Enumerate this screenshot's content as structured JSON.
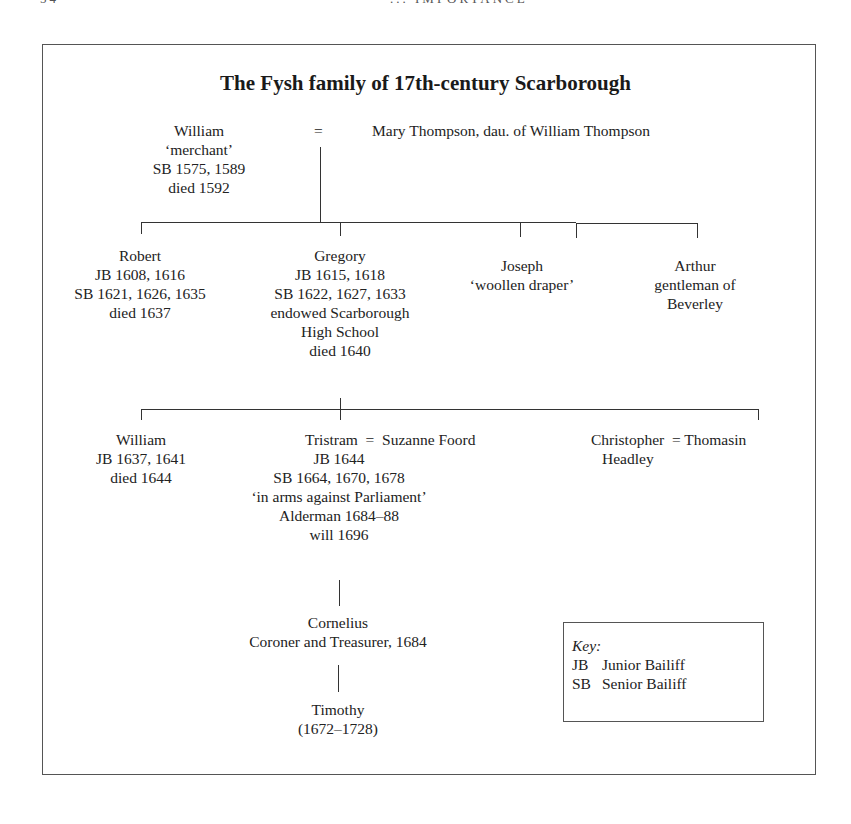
{
  "running_head": {
    "page_number": "54",
    "chapter": "... IMPORTANCE"
  },
  "diagram": {
    "title": "The Fysh family of 17th-century Scarborough",
    "generation_1": {
      "person": {
        "name": "William",
        "lines": [
          "‘merchant’",
          "SB 1575, 1589",
          "died 1592"
        ]
      },
      "marriage_symbol": "=",
      "spouse": "Mary Thompson, dau. of William Thompson"
    },
    "generation_2": [
      {
        "name": "Robert",
        "lines": [
          "JB 1608, 1616",
          "SB 1621, 1626, 1635",
          "died 1637"
        ]
      },
      {
        "name": "Gregory",
        "lines": [
          "JB 1615, 1618",
          "SB 1622, 1627, 1633",
          "endowed Scarborough",
          "High School",
          "died 1640"
        ]
      },
      {
        "name": "Joseph",
        "lines": [
          "‘woollen draper’"
        ]
      },
      {
        "name": "Arthur",
        "lines": [
          "gentleman of",
          "Beverley"
        ]
      }
    ],
    "generation_3": [
      {
        "name": "William",
        "lines": [
          "JB 1637, 1641",
          "died 1644"
        ]
      },
      {
        "name": "Tristram",
        "spouse": "Suzanne Foord",
        "marriage_symbol": "=",
        "lines": [
          "JB 1644",
          "SB 1664, 1670, 1678",
          "‘in arms against Parliament’",
          "Alderman 1684–88",
          "will 1696"
        ]
      },
      {
        "name": "Christopher",
        "spouse": "Thomasin",
        "spouse_line2": "Headley",
        "marriage_symbol": "="
      }
    ],
    "generation_4": {
      "name": "Cornelius",
      "lines": [
        "Coroner and Treasurer, 1684"
      ]
    },
    "generation_5": {
      "name": "Timothy",
      "lines": [
        "(1672–1728)"
      ]
    },
    "key": {
      "title": "Key:",
      "entries": [
        {
          "abbr": "JB",
          "meaning": "Junior Bailiff"
        },
        {
          "abbr": "SB",
          "meaning": "Senior Bailiff"
        }
      ]
    }
  }
}
